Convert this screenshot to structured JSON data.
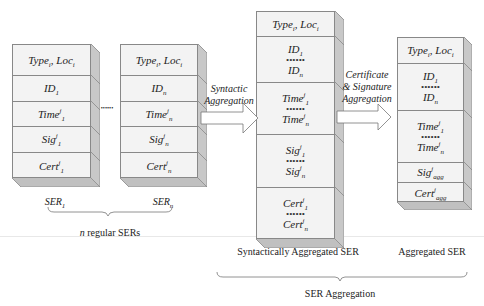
{
  "regular_sers": [
    {
      "name": "ser-1",
      "label_main": "SER",
      "label_sub": "1",
      "cells": [
        {
          "parts": [
            {
              "t": "Type"
            },
            {
              "sub": "i"
            },
            {
              "t": ", Loc"
            },
            {
              "sub": "i"
            }
          ]
        },
        {
          "parts": [
            {
              "t": "ID"
            },
            {
              "sub": "1"
            }
          ]
        },
        {
          "parts": [
            {
              "t": "Time"
            },
            {
              "sup": "j"
            },
            {
              "sub": "1"
            }
          ]
        },
        {
          "parts": [
            {
              "t": "Sig"
            },
            {
              "sup": "j"
            },
            {
              "sub": "1"
            }
          ]
        },
        {
          "parts": [
            {
              "t": "Cert"
            },
            {
              "sup": "j"
            },
            {
              "sub": "1"
            }
          ]
        }
      ]
    },
    {
      "name": "ser-n",
      "label_main": "SER",
      "label_sub": "n",
      "cells": [
        {
          "parts": [
            {
              "t": "Type"
            },
            {
              "sub": "i"
            },
            {
              "t": ", Loc"
            },
            {
              "sub": "i"
            }
          ]
        },
        {
          "parts": [
            {
              "t": "ID"
            },
            {
              "sub": "n"
            }
          ]
        },
        {
          "parts": [
            {
              "t": "Time"
            },
            {
              "sup": "j"
            },
            {
              "sub": "n"
            }
          ]
        },
        {
          "parts": [
            {
              "t": "Sig"
            },
            {
              "sup": "j"
            },
            {
              "sub": "n"
            }
          ]
        },
        {
          "parts": [
            {
              "t": "Cert"
            },
            {
              "sup": "j"
            },
            {
              "sub": "n"
            }
          ]
        }
      ]
    }
  ],
  "between_dots": "••••••",
  "regular_caption": {
    "n": "n",
    "text": " regular SERs"
  },
  "arrow1_label": [
    "Syntactic",
    "Aggregation"
  ],
  "arrow2_label": [
    "Certificate",
    "& Signature",
    "Aggregation"
  ],
  "syntactic_ser": {
    "cells": [
      {
        "rows": [
          [
            {
              "t": "Type"
            },
            {
              "sub": "i"
            },
            {
              "t": ", Loc"
            },
            {
              "sub": "i"
            }
          ]
        ]
      },
      {
        "rows": [
          [
            {
              "t": "ID"
            },
            {
              "sub": "1"
            }
          ],
          "dots",
          [
            {
              "t": "ID"
            },
            {
              "sub": "n"
            }
          ]
        ]
      },
      {
        "rows": [
          [
            {
              "t": "Time"
            },
            {
              "sup": "j"
            },
            {
              "sub": "1"
            }
          ],
          "dots",
          [
            {
              "t": "Time"
            },
            {
              "sup": "j"
            },
            {
              "sub": "n"
            }
          ]
        ]
      },
      {
        "rows": [
          [
            {
              "t": "Sig"
            },
            {
              "sup": "j"
            },
            {
              "sub": "1"
            }
          ],
          "dots",
          [
            {
              "t": "Sig"
            },
            {
              "sup": "j"
            },
            {
              "sub": "n"
            }
          ]
        ]
      },
      {
        "rows": [
          [
            {
              "t": "Cert"
            },
            {
              "sup": "j"
            },
            {
              "sub": "1"
            }
          ],
          "dots",
          [
            {
              "t": "Cert"
            },
            {
              "sup": "j"
            },
            {
              "sub": "n"
            }
          ]
        ]
      }
    ],
    "caption": "Syntactically Aggregated SER"
  },
  "aggregated_ser": {
    "cells": [
      {
        "rows": [
          [
            {
              "t": "Type"
            },
            {
              "sub": "i"
            },
            {
              "t": ", Loc"
            },
            {
              "sub": "i"
            }
          ]
        ]
      },
      {
        "rows": [
          [
            {
              "t": "ID"
            },
            {
              "sub": "1"
            }
          ],
          "dots",
          [
            {
              "t": "ID"
            },
            {
              "sub": "n"
            }
          ]
        ]
      },
      {
        "rows": [
          [
            {
              "t": "Time"
            },
            {
              "sup": "j"
            },
            {
              "sub": "1"
            }
          ],
          "dots",
          [
            {
              "t": "Time"
            },
            {
              "sup": "j"
            },
            {
              "sub": "n"
            }
          ]
        ]
      },
      {
        "rows": [
          [
            {
              "t": "Sig"
            },
            {
              "sup": "j"
            },
            {
              "sub": "agg"
            }
          ]
        ]
      },
      {
        "rows": [
          [
            {
              "t": "Cert"
            },
            {
              "sup": "j"
            },
            {
              "sub": "agg"
            }
          ]
        ]
      }
    ],
    "caption": "Aggregated SER"
  },
  "dots_text": "••••••",
  "aggregation_caption": "SER Aggregation",
  "colors": {
    "face": "#f3f3f3",
    "side": "#c8c8c8",
    "bottom": "#c0c0c0",
    "border": "#888888"
  }
}
